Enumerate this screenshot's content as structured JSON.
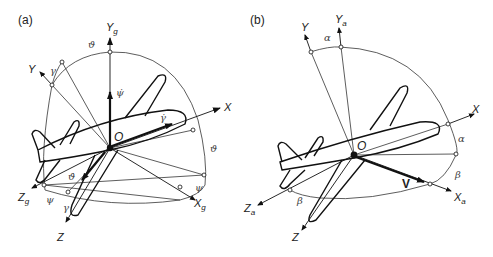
{
  "panel_a": {
    "label": "(a)",
    "axes": {
      "Yg": {
        "main": "Y",
        "sub": "g"
      },
      "Y": {
        "main": "Y"
      },
      "X": {
        "main": "X"
      },
      "Zg": {
        "main": "Z",
        "sub": "g"
      },
      "Z": {
        "main": "Z"
      },
      "Xg": {
        "main": "X",
        "sub": "g"
      }
    },
    "origin": "O",
    "angles": {
      "theta_top": "ϑ",
      "gamma_top": "γ",
      "psi_dot": "ψ̇",
      "gamma_dot": "γ̇",
      "theta_right": "ϑ",
      "theta_dot": "ϑ̇",
      "psi_left": "ψ",
      "gamma_bottom": "γ",
      "psi_right": "ψ"
    }
  },
  "panel_b": {
    "label": "(b)",
    "axes": {
      "Y": {
        "main": "Y"
      },
      "Ya": {
        "main": "Y",
        "sub": "a"
      },
      "X": {
        "main": "X"
      },
      "Xa": {
        "main": "X",
        "sub": "a"
      },
      "Za": {
        "main": "Z",
        "sub": "a"
      },
      "Z": {
        "main": "Z"
      }
    },
    "origin": "O",
    "velocity": "V",
    "angles": {
      "alpha_top": "α",
      "alpha_right": "α",
      "beta_right": "β",
      "beta_bottom": "β"
    }
  }
}
